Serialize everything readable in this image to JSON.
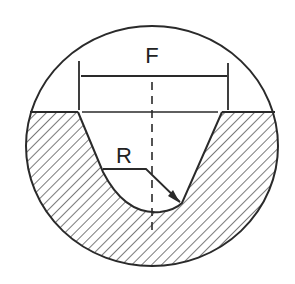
{
  "diagram": {
    "labels": {
      "width": "F",
      "radius": "R"
    },
    "colors": {
      "stroke": "#2a2a2a",
      "hatch": "#333333",
      "background": "#ffffff"
    }
  }
}
